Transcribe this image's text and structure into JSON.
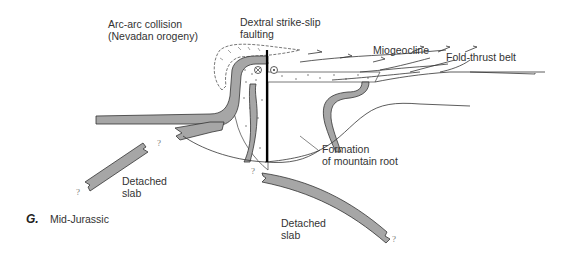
{
  "figure": {
    "letter": "G.",
    "caption": "Mid-Jurassic"
  },
  "labels": {
    "arc_collision": {
      "line1": "Arc-arc collision",
      "line2": "(Nevadan orogeny)"
    },
    "dextral": {
      "line1": "Dextral strike-slip",
      "line2": "faulting"
    },
    "miogeocline": "Miogeocline",
    "fold_thrust": "Fold-thrust belt",
    "mountain_root": {
      "line1": "Formation",
      "line2": "of mountain root"
    },
    "detached_slab_left": {
      "line1": "Detached",
      "line2": "slab"
    },
    "detached_slab_right": {
      "line1": "Detached",
      "line2": "slab"
    }
  },
  "question_mark": "?",
  "colors": {
    "slab_fill": "#a6a6a6",
    "outline": "#333333",
    "fault": "#000000"
  }
}
